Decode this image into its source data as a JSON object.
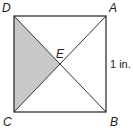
{
  "diagram": {
    "type": "geometry-square-with-diagonals",
    "vertices": {
      "D": {
        "label": "D",
        "x": 14,
        "y": 16
      },
      "A": {
        "label": "A",
        "x": 106,
        "y": 16
      },
      "B": {
        "label": "B",
        "x": 106,
        "y": 112
      },
      "C": {
        "label": "C",
        "x": 14,
        "y": 112
      },
      "E": {
        "label": "E",
        "x": 60,
        "y": 64
      }
    },
    "side_label": "1 in.",
    "shaded_region": [
      "D",
      "E",
      "C"
    ],
    "colors": {
      "stroke": "#333333",
      "shade": "#c8c8c8",
      "text": "#222222"
    }
  }
}
